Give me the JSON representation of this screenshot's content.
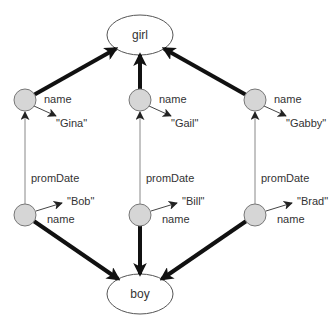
{
  "diagram": {
    "classes": [
      {
        "id": "girl",
        "label": "girl"
      },
      {
        "id": "boy",
        "label": "boy"
      }
    ],
    "columns": [
      {
        "girl": {
          "name": "Gina"
        },
        "boy": {
          "name": "Bob"
        },
        "girl_name_label": "name",
        "girl_value_label": "\"Gina\"",
        "boy_name_label": "name",
        "boy_value_label": "\"Bob\"",
        "prom_label": "promDate"
      },
      {
        "girl": {
          "name": "Gail"
        },
        "boy": {
          "name": "Bill"
        },
        "girl_name_label": "name",
        "girl_value_label": "\"Gail\"",
        "boy_name_label": "name",
        "boy_value_label": "\"Bill\"",
        "prom_label": "promDate"
      },
      {
        "girl": {
          "name": "Gabby"
        },
        "boy": {
          "name": "Brad"
        },
        "girl_name_label": "name",
        "girl_value_label": "\"Gabby\"",
        "boy_name_label": "name",
        "boy_value_label": "\"Brad\"",
        "prom_label": "promDate"
      }
    ],
    "edge_types": {
      "type_edge": "instance-of",
      "name_edge": "name",
      "prom_edge": "promDate"
    },
    "colors": {
      "node_fill": "#d6d6d6",
      "node_stroke": "#777777",
      "thick_edge": "#111111",
      "thin_edge": "#888888",
      "text": "#333333"
    }
  }
}
